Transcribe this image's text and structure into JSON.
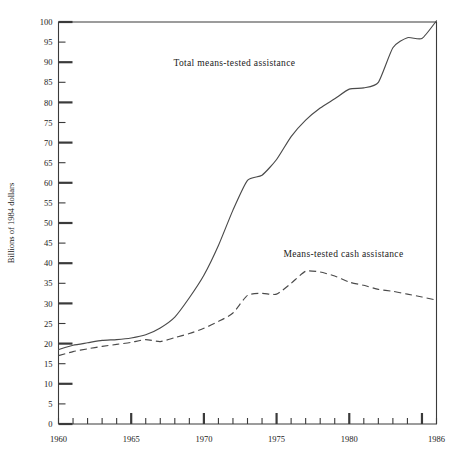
{
  "chart_data": {
    "type": "line",
    "title": "",
    "subtitle": "",
    "xlabel": "",
    "ylabel": "Billions of 1984 dollars",
    "xlim": [
      1960,
      1986
    ],
    "ylim": [
      0,
      100
    ],
    "ytick_step": 5,
    "xtick_step": 1,
    "xtick_major_step": 5,
    "grid": false,
    "legend_position": "inline-annotation",
    "x": [
      1960,
      1961,
      1962,
      1963,
      1964,
      1965,
      1966,
      1967,
      1968,
      1969,
      1970,
      1971,
      1972,
      1973,
      1974,
      1975,
      1976,
      1977,
      1978,
      1979,
      1980,
      1981,
      1982,
      1983,
      1984,
      1985,
      1986
    ],
    "ytick_labels": [
      "0",
      "5",
      "10",
      "15",
      "20",
      "25",
      "30",
      "35",
      "40",
      "45",
      "50",
      "55",
      "60",
      "65",
      "70",
      "75",
      "80",
      "85",
      "90",
      "95",
      "100"
    ],
    "ytick_values": [
      0,
      5,
      10,
      15,
      20,
      25,
      30,
      35,
      40,
      45,
      50,
      55,
      60,
      65,
      70,
      75,
      80,
      85,
      90,
      95,
      100
    ],
    "xtick_labels": [
      "1960",
      "1965",
      "1970",
      "1975",
      "1980",
      "1986"
    ],
    "xtick_values": [
      1960,
      1965,
      1970,
      1975,
      1980,
      1986
    ],
    "series": [
      {
        "name": "Total means-tested assistance",
        "style": "solid",
        "color": "#4a4a4a",
        "annotation_x": 1972.1,
        "annotation_y": 89.0,
        "values": [
          18.5,
          19.6,
          20.2,
          20.8,
          21.0,
          21.4,
          22.2,
          23.9,
          26.6,
          31.4,
          37.0,
          44.4,
          53.2,
          60.6,
          61.9,
          65.8,
          71.5,
          75.6,
          78.6,
          80.9,
          83.3,
          83.6,
          85.0,
          93.6,
          96.1,
          95.9,
          100.3
        ]
      },
      {
        "name": "Means-tested cash assistance",
        "style": "dashed",
        "color": "#4a4a4a",
        "annotation_x": 1979.6,
        "annotation_y": 41.5,
        "values": [
          17.0,
          18.0,
          18.7,
          19.3,
          19.8,
          20.3,
          21.0,
          20.5,
          21.5,
          22.5,
          23.8,
          25.5,
          27.6,
          32.0,
          32.5,
          32.3,
          35.0,
          38.0,
          37.8,
          36.8,
          35.3,
          34.5,
          33.5,
          33.0,
          32.3,
          31.6,
          30.8
        ]
      }
    ]
  }
}
